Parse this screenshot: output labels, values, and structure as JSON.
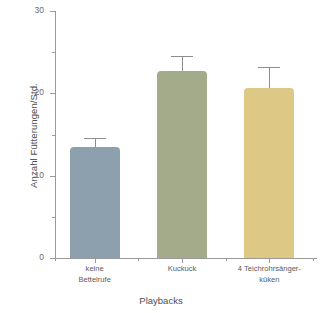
{
  "chart_data": {
    "type": "bar",
    "title": "",
    "xlabel": "Playbacks",
    "ylabel": "Anzahl Fütterungen/Std.",
    "categories": [
      "keine Bettelrufe",
      "Kuckuck",
      "4 Teichrohrsänger-küken"
    ],
    "category_lines": [
      [
        "keine",
        "Bettelrufe"
      ],
      [
        "Kuckuck"
      ],
      [
        "4 Teichrohrsänger-",
        "küken"
      ]
    ],
    "values": [
      13.5,
      22.7,
      20.6
    ],
    "errors": [
      1.1,
      1.8,
      2.6
    ],
    "colors": [
      "#8da0ad",
      "#a3ab8a",
      "#ddc886"
    ],
    "ylim": [
      0,
      30
    ],
    "yticks": [
      0,
      10,
      20,
      30
    ],
    "ytick_labels": [
      "0",
      "10",
      "20",
      "30"
    ],
    "yticks_minor": [
      5,
      15,
      25
    ],
    "grid": false,
    "legend": null
  },
  "axis": {
    "y_title": "Anzahl Fütterungen/Std.",
    "x_title": "Playbacks",
    "y_labels": [
      "30",
      "20",
      "10",
      "0"
    ]
  }
}
